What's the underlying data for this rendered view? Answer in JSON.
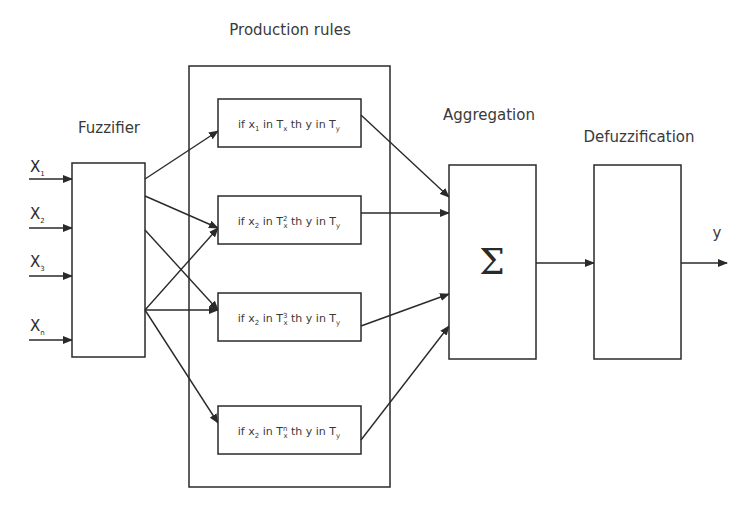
{
  "title_labels": {
    "production_rules": "Production rules",
    "fuzzifier": "Fuzzifier",
    "aggregation": "Aggregation",
    "defuzzification": "Defuzzification"
  },
  "inputs": [
    {
      "base": "X",
      "sub": "1"
    },
    {
      "base": "X",
      "sub": "2"
    },
    {
      "base": "X",
      "sub": "3"
    },
    {
      "base": "X",
      "sub": "n"
    }
  ],
  "rules": [
    {
      "x_sub": "1",
      "t_sup": "",
      "text": "if x1 in Tx th y in Ty"
    },
    {
      "x_sub": "2",
      "t_sup": "2",
      "text": "if x2 in Tx2 th y in Ty"
    },
    {
      "x_sub": "2",
      "t_sup": "3",
      "text": "if x2 in Tx3 th y in Ty"
    },
    {
      "x_sub": "2",
      "t_sup": "n",
      "text": "if x2 in Txn th y in Ty"
    }
  ],
  "aggregation_symbol": "Σ",
  "output_label": "y",
  "colors": {
    "stroke": "#2a2a2a",
    "background": "#ffffff",
    "text": "#3a3a3a"
  }
}
